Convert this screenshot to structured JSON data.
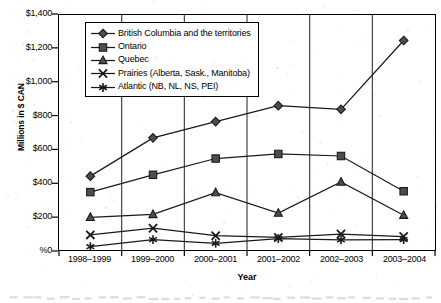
{
  "chart_data": {
    "type": "line",
    "title": "",
    "xlabel": "Year",
    "ylabel": "Millions in $ CAN",
    "categories": [
      "1998–1999",
      "1999–2000",
      "2000–2001",
      "2001–2002",
      "2002–2003",
      "2003–2004"
    ],
    "ylim": [
      0,
      1400
    ],
    "yticks": [
      0,
      200,
      400,
      600,
      800,
      1000,
      1200,
      1400
    ],
    "ytick_labels": [
      "%0",
      "$200",
      "$400",
      "$600",
      "$800",
      "$1,000",
      "$1,200",
      "$1,400"
    ],
    "grid": "vertical",
    "legend_position": "upper-left-inside",
    "series": [
      {
        "name": "British Columbia and the territories",
        "marker": "diamond",
        "values": [
          440,
          668,
          765,
          860,
          838,
          1248
        ]
      },
      {
        "name": "Ontario",
        "marker": "square",
        "values": [
          345,
          448,
          545,
          572,
          560,
          350
        ]
      },
      {
        "name": "Quebec",
        "marker": "triangle",
        "values": [
          195,
          212,
          342,
          220,
          405,
          207
        ]
      },
      {
        "name": "Prairies (Alberta, Sask., Manitoba)",
        "marker": "cross",
        "values": [
          90,
          130,
          85,
          75,
          95,
          80
        ]
      },
      {
        "name": "Atlantic (NB, NL, NS, PEI)",
        "marker": "asterisk",
        "values": [
          20,
          62,
          40,
          68,
          60,
          62
        ]
      }
    ],
    "colors": {
      "line": "#1a1a1a",
      "marker_fill": "#4d4d4d",
      "grid": "#333333",
      "axis": "#000000",
      "background": "#ffffff"
    }
  }
}
